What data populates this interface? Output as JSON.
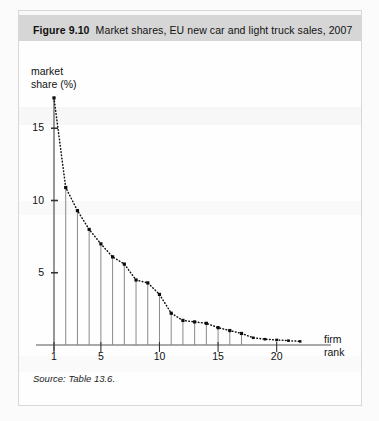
{
  "figure": {
    "label": "Figure 9.10",
    "title": "Market shares, EU new car and light truck sales, 2007",
    "source": "Source: Table 13.6."
  },
  "axes": {
    "y_label_line1": "market",
    "y_label_line2": "share (%)",
    "x_label_line1": "firm",
    "x_label_line2": "rank",
    "y_ticks": [
      "5",
      "10",
      "15"
    ],
    "x_ticks": [
      "1",
      "5",
      "10",
      "15",
      "20"
    ]
  },
  "chart_data": {
    "type": "scatter",
    "title": "Market shares, EU new car and light truck sales, 2007",
    "xlabel": "firm rank",
    "ylabel": "market share (%)",
    "xlim": [
      0,
      23.5
    ],
    "ylim": [
      0,
      18.5
    ],
    "grid": false,
    "legend": null,
    "marker": "square",
    "connector": "dotted-line",
    "droplines": true,
    "dropline_max_rank": 17,
    "x_tick_values": [
      1,
      5,
      10,
      15,
      20
    ],
    "y_tick_values": [
      5,
      10,
      15
    ],
    "x": [
      1,
      2,
      3,
      4,
      5,
      6,
      7,
      8,
      9,
      10,
      11,
      12,
      13,
      14,
      15,
      16,
      17,
      18,
      19,
      20,
      21,
      22
    ],
    "values": [
      17.1,
      10.9,
      9.3,
      8.0,
      7.0,
      6.1,
      5.6,
      4.5,
      4.3,
      3.5,
      2.2,
      1.7,
      1.6,
      1.5,
      1.2,
      1.0,
      0.8,
      0.5,
      0.4,
      0.35,
      0.3,
      0.25
    ],
    "categories": [
      "1",
      "2",
      "3",
      "4",
      "5",
      "6",
      "7",
      "8",
      "9",
      "10",
      "11",
      "12",
      "13",
      "14",
      "15",
      "16",
      "17",
      "18",
      "19",
      "20",
      "21",
      "22"
    ],
    "series": [
      {
        "name": "market share (%)",
        "values": [
          17.1,
          10.9,
          9.3,
          8.0,
          7.0,
          6.1,
          5.6,
          4.5,
          4.3,
          3.5,
          2.2,
          1.7,
          1.6,
          1.5,
          1.2,
          1.0,
          0.8,
          0.5,
          0.4,
          0.35,
          0.3,
          0.25
        ]
      }
    ]
  }
}
